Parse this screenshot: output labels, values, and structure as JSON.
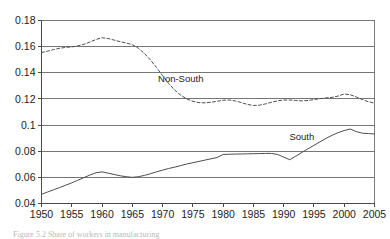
{
  "chart_data": {
    "type": "line",
    "title": "",
    "subtitle": "",
    "xlabel": "",
    "ylabel": "",
    "xlim": [
      1950,
      2005
    ],
    "ylim": [
      0.04,
      0.18
    ],
    "grid": true,
    "legend_position": "inline-annotations",
    "x_ticks": [
      1950,
      1955,
      1960,
      1965,
      1970,
      1975,
      1980,
      1985,
      1990,
      1995,
      2000,
      2005
    ],
    "x_tick_labels": [
      "1950",
      "1955",
      "1960",
      "1965",
      "1970",
      "1975",
      "1980",
      "1985",
      "1990",
      "1995",
      "2000",
      "2005"
    ],
    "y_ticks": [
      0.04,
      0.06,
      0.08,
      0.1,
      0.12,
      0.14,
      0.16,
      0.18
    ],
    "y_tick_labels": [
      "0.04",
      "0.06",
      "0.08",
      "0.1",
      "0.12",
      "0.14",
      "0.16",
      "0.18"
    ],
    "series": [
      {
        "name": "Non-South",
        "style": "dashed",
        "x": [
          1950,
          1951,
          1952,
          1953,
          1954,
          1955,
          1956,
          1957,
          1958,
          1959,
          1960,
          1961,
          1962,
          1963,
          1964,
          1965,
          1966,
          1967,
          1968,
          1969,
          1970,
          1971,
          1972,
          1973,
          1974,
          1975,
          1976,
          1977,
          1978,
          1979,
          1980,
          1981,
          1982,
          1983,
          1984,
          1985,
          1986,
          1987,
          1988,
          1989,
          1990,
          1991,
          1992,
          1993,
          1994,
          1995,
          1996,
          1997,
          1998,
          1999,
          2000,
          2001,
          2002,
          2003,
          2004,
          2005
        ],
        "values": [
          0.1555,
          0.1565,
          0.1578,
          0.1588,
          0.1594,
          0.1598,
          0.1606,
          0.1618,
          0.1635,
          0.1655,
          0.1668,
          0.1662,
          0.165,
          0.1638,
          0.1628,
          0.1615,
          0.1588,
          0.1548,
          0.1498,
          0.144,
          0.1378,
          0.1318,
          0.1268,
          0.1228,
          0.12,
          0.1182,
          0.1172,
          0.117,
          0.1175,
          0.1182,
          0.119,
          0.1192,
          0.1185,
          0.1172,
          0.1158,
          0.115,
          0.1152,
          0.1162,
          0.1175,
          0.1185,
          0.1192,
          0.1192,
          0.1188,
          0.1185,
          0.1188,
          0.1195,
          0.1202,
          0.1208,
          0.1212,
          0.1222,
          0.1238,
          0.1232,
          0.1215,
          0.1195,
          0.1178,
          0.1168
        ]
      },
      {
        "name": "South",
        "style": "solid",
        "x": [
          1950,
          1951,
          1952,
          1953,
          1954,
          1955,
          1956,
          1957,
          1958,
          1959,
          1960,
          1961,
          1962,
          1963,
          1964,
          1965,
          1966,
          1967,
          1968,
          1969,
          1970,
          1971,
          1972,
          1973,
          1974,
          1975,
          1976,
          1977,
          1978,
          1979,
          1980,
          1981,
          1982,
          1983,
          1984,
          1985,
          1986,
          1987,
          1988,
          1989,
          1990,
          1991,
          1992,
          1993,
          1994,
          1995,
          1996,
          1997,
          1998,
          1999,
          2000,
          2001,
          2002,
          2003,
          2004,
          2005
        ],
        "values": [
          0.047,
          0.0488,
          0.0505,
          0.0522,
          0.054,
          0.0558,
          0.0578,
          0.0598,
          0.0618,
          0.0635,
          0.0642,
          0.0632,
          0.0622,
          0.0612,
          0.0605,
          0.06,
          0.0605,
          0.0615,
          0.0628,
          0.0642,
          0.0655,
          0.0668,
          0.0678,
          0.069,
          0.0702,
          0.0712,
          0.0722,
          0.0732,
          0.0742,
          0.0752,
          0.0775,
          0.0777,
          0.0778,
          0.0779,
          0.078,
          0.0781,
          0.0782,
          0.0783,
          0.0783,
          0.0775,
          0.0755,
          0.0735,
          0.0762,
          0.079,
          0.0818,
          0.0845,
          0.0872,
          0.0898,
          0.0922,
          0.0942,
          0.0958,
          0.097,
          0.095,
          0.0938,
          0.0935,
          0.0932
        ]
      }
    ],
    "annotations": [
      {
        "text": "Non-South",
        "x": 1973,
        "y": 0.133
      },
      {
        "text": "South",
        "x": 1993,
        "y": 0.0885
      }
    ]
  },
  "caption": {
    "text": "Figure 5.2 Share of workers in manufacturing"
  },
  "colors": {
    "line": "#4e4e4e",
    "grid": "#676767",
    "axis": "#4a4a4a",
    "text": "#1c1c1c",
    "background": "#ffffff"
  }
}
